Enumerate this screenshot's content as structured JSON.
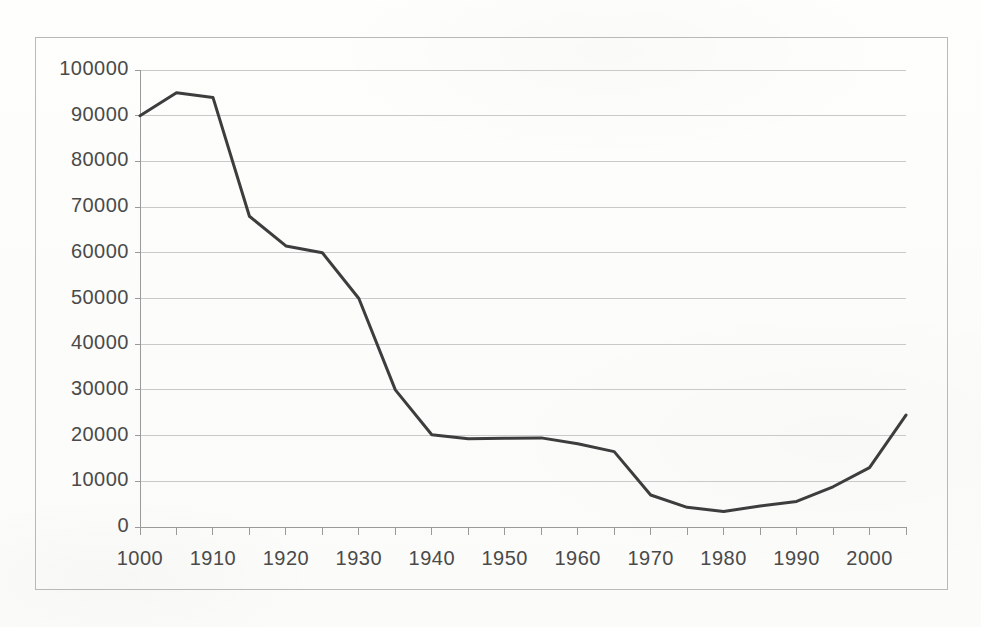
{
  "figure": {
    "background_color": "#fdfdfc",
    "frame_color": "#b9b9b9",
    "gridline_color": "#c9c9c9",
    "axis_color": "#9a9a9a",
    "series_color": "#3d3d3d",
    "tick_label_color": "#4a4a4a"
  },
  "chart_data": {
    "type": "line",
    "title": "",
    "subtitle": "",
    "xlabel": "",
    "ylabel": "",
    "xlim": [
      1900,
      2005
    ],
    "ylim": [
      0,
      100000
    ],
    "grid": true,
    "grid_axis": "y",
    "legend": false,
    "legend_position": "none",
    "y_tick_values": [
      0,
      10000,
      20000,
      30000,
      40000,
      50000,
      60000,
      70000,
      80000,
      90000,
      100000
    ],
    "y_tick_labels": [
      "0",
      "10000",
      "20000",
      "30000",
      "40000",
      "50000",
      "60000",
      "70000",
      "80000",
      "90000",
      "100000"
    ],
    "x_tick_values": [
      1900,
      1910,
      1920,
      1930,
      1940,
      1950,
      1960,
      1970,
      1980,
      1990,
      2000
    ],
    "x_tick_labels": [
      "1000",
      "1910",
      "1920",
      "1930",
      "1940",
      "1950",
      "1960",
      "1970",
      "1980",
      "1990",
      "2000"
    ],
    "x_minor_tick_values": [
      1905,
      1915,
      1925,
      1935,
      1945,
      1955,
      1965,
      1975,
      1985,
      1995,
      2005
    ],
    "x": [
      1900,
      1905,
      1910,
      1915,
      1920,
      1925,
      1930,
      1935,
      1940,
      1945,
      1950,
      1955,
      1960,
      1965,
      1970,
      1975,
      1980,
      1985,
      1990,
      1995,
      2000,
      2005
    ],
    "series": [
      {
        "name": "series-1",
        "color": "#3d3d3d",
        "line_width": 3,
        "markers": false,
        "values": [
          90000,
          95000,
          94000,
          68000,
          61500,
          60000,
          50000,
          30000,
          20200,
          19300,
          19400,
          19500,
          18200,
          16500,
          7000,
          4300,
          3400,
          4600,
          5600,
          8800,
          13000,
          24500
        ]
      }
    ],
    "annotations": []
  }
}
